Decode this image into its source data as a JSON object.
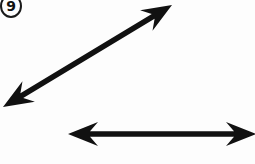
{
  "figure": {
    "number_label": "9",
    "badge_name": "figure-number-badge",
    "background_color": "#fdfdfd",
    "ink_color": "#111111",
    "width": 255,
    "height": 164
  },
  "arrows": [
    {
      "id": "diagonal-arrow",
      "label": "diagonal double-headed arrow",
      "orientation": "diagonal",
      "direction": "double-headed",
      "heads": [
        "lower-left",
        "upper-right"
      ],
      "start_x": 3,
      "start_y": 107,
      "end_x": 172,
      "end_y": 5,
      "shaft_thickness": 5.5,
      "head_length": 30,
      "head_half_width": 12,
      "head_notch": 8,
      "color": "#111111",
      "clipped": "none"
    },
    {
      "id": "horizontal-arrow",
      "label": "horizontal double-headed arrow",
      "orientation": "horizontal",
      "direction": "double-headed",
      "heads": [
        "left",
        "right"
      ],
      "start_x": 68,
      "start_y": 134,
      "end_x": 256,
      "end_y": 134,
      "shaft_thickness": 5.5,
      "head_length": 30,
      "head_half_width": 12,
      "head_notch": 8,
      "color": "#111111",
      "clipped": "right-edge"
    }
  ]
}
